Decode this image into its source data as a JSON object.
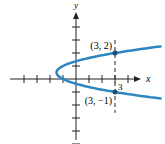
{
  "chart_data": {
    "type": "line",
    "title": "",
    "xlabel": "x",
    "ylabel": "y",
    "equation": "x = 2y^2 - 2y - 1",
    "xlim": [
      -4,
      4
    ],
    "ylim": [
      -5,
      5
    ],
    "x_ticks": [
      -4,
      -3,
      -2,
      -1,
      1,
      2,
      3,
      4
    ],
    "y_ticks": [
      -5,
      -4,
      -3,
      -2,
      -1,
      1,
      2,
      3,
      4
    ],
    "tick_labels": [
      {
        "axis": "x",
        "value": 3,
        "text": "3"
      }
    ],
    "curve_y_range": [
      -1.5,
      2.5
    ],
    "color": "#2e86c1",
    "points": [
      {
        "x": 3,
        "y": 2,
        "label": "(3, 2)"
      },
      {
        "x": 3,
        "y": -1,
        "label": "(3, −1)"
      }
    ],
    "guide_line": {
      "x": 3,
      "style": "dashed"
    },
    "grid": false
  }
}
